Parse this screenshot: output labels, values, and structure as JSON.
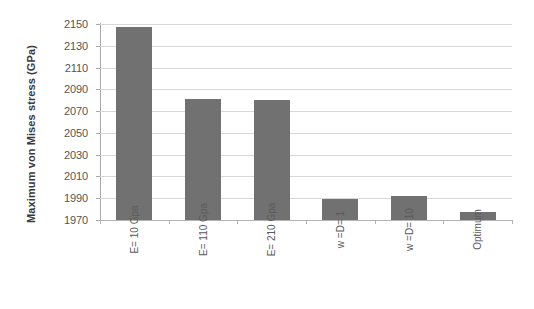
{
  "chart_data": {
    "type": "bar",
    "title": "",
    "subtitle": "",
    "xlabel": "",
    "ylabel": "Maximum von Mises stress (GPa)",
    "categories": [
      "E= 10 Gpa",
      "E= 110 Gpa",
      "E= 210 Gpa",
      "w =D= 1",
      "w =D= 10",
      "Optimum"
    ],
    "values": [
      2147,
      2081,
      2080,
      1989,
      1992,
      1977
    ],
    "ylim": [
      1970,
      2150
    ],
    "ytick_step": 20,
    "ytick_labels": [
      "2150",
      "2130",
      "2110",
      "2090",
      "2070",
      "2050",
      "2030",
      "2010",
      "1990",
      "1970"
    ],
    "ytick_values": [
      2150,
      2130,
      2110,
      2090,
      2070,
      2050,
      2030,
      2010,
      1990,
      1970
    ],
    "grid": true,
    "legend": false,
    "legend_position": "none",
    "bar_color": "#717171",
    "gridline_color": "#d7d7d7",
    "axis_color": "#a9a9a9",
    "tick_label_color": "#555555",
    "axis_title_color": "#3a3a3a",
    "background_color": "#ffffff",
    "series": [
      {
        "name": "Maximum von Mises stress",
        "values": [
          2147,
          2081,
          2080,
          1989,
          1992,
          1977
        ]
      }
    ]
  }
}
